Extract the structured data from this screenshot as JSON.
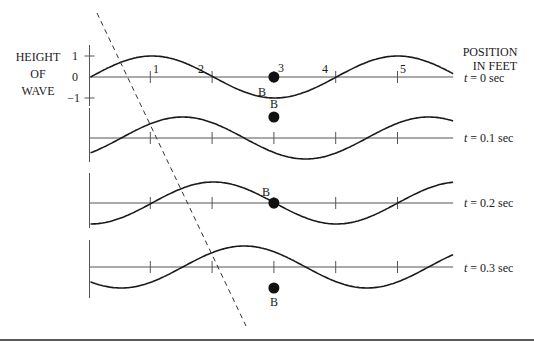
{
  "figure": {
    "y_axis_title": [
      "HEIGHT",
      "OF",
      "WAVE"
    ],
    "x_axis_title": [
      "POSITION",
      "IN FEET"
    ],
    "y_tick_labels": [
      "1",
      "0",
      "−1"
    ],
    "x_tick_labels": [
      "1",
      "2",
      "3",
      "4",
      "5"
    ],
    "point_label": "B",
    "point_position_ft": 3,
    "wave": {
      "amplitude": 1,
      "wavelength_ft": 2,
      "speed_ft_per_sec": 5,
      "x_range_ft": [
        0,
        5.9
      ]
    },
    "rows": [
      {
        "time_label_italic": "t",
        "time_label_rest": " = 0 sec",
        "t": 0,
        "point_height": 0
      },
      {
        "time_label_italic": "t",
        "time_label_rest": " = 0.1 sec",
        "t": 0.1,
        "point_height": 1
      },
      {
        "time_label_italic": "t",
        "time_label_rest": " = 0.2 sec",
        "t": 0.2,
        "point_height": 0
      },
      {
        "time_label_italic": "t",
        "time_label_rest": " = 0.3 sec",
        "t": 0.3,
        "point_height": -1
      }
    ],
    "crest_tracking_line": "dashed"
  }
}
